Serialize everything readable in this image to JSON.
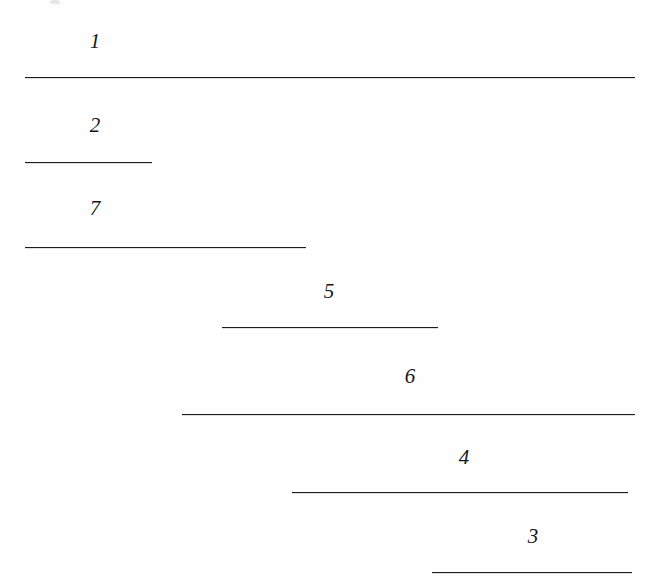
{
  "figure": {
    "type": "interval-diagram",
    "background_color": "#fefefe",
    "line_color": "#1d1d1f",
    "label_color": "#16161a",
    "width": 660,
    "height": 584,
    "artifact": {
      "name": "scan-speck",
      "x": 50,
      "y": 0,
      "width": 10,
      "height": 4
    }
  },
  "chart_data": {
    "type": "bar",
    "title": "",
    "xlabel": "",
    "ylabel": "",
    "grid": false,
    "legend": "none",
    "orientation": "horizontal",
    "xlim": [
      0,
      660
    ],
    "categories": [
      "1",
      "2",
      "7",
      "5",
      "6",
      "4",
      "3"
    ],
    "intervals": [
      {
        "label": "1",
        "start": 25,
        "end": 635,
        "length": 610,
        "y": 77,
        "label_x": 95,
        "label_y": 31
      },
      {
        "label": "2",
        "start": 25,
        "end": 152,
        "length": 127,
        "y": 162,
        "label_x": 95,
        "label_y": 115
      },
      {
        "label": "7",
        "start": 25,
        "end": 306,
        "length": 281,
        "y": 247,
        "label_x": 95,
        "label_y": 198
      },
      {
        "label": "5",
        "start": 222,
        "end": 438,
        "length": 216,
        "y": 327,
        "label_x": 329,
        "label_y": 281
      },
      {
        "label": "6",
        "start": 182,
        "end": 635,
        "length": 453,
        "y": 414,
        "label_x": 410,
        "label_y": 366
      },
      {
        "label": "4",
        "start": 292,
        "end": 628,
        "length": 336,
        "y": 492,
        "label_x": 464,
        "label_y": 447
      },
      {
        "label": "3",
        "start": 432,
        "end": 632,
        "length": 200,
        "y": 572,
        "label_x": 533,
        "label_y": 526
      }
    ],
    "values": [
      610,
      127,
      281,
      216,
      453,
      336,
      200
    ],
    "starts": [
      25,
      25,
      25,
      222,
      182,
      292,
      432
    ]
  }
}
